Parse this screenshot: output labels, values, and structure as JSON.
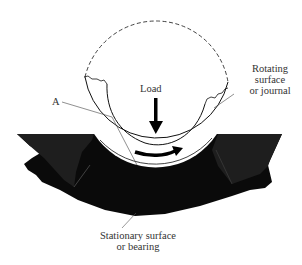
{
  "figure": {
    "labels": {
      "load": "Load",
      "point_a": "A",
      "rotating": [
        "Rotating",
        "surface",
        "or journal"
      ],
      "stationary": [
        "Stationary surface",
        "or bearing"
      ]
    },
    "colors": {
      "ink": "#000000",
      "bearing_fill": "#0a0a0a",
      "bearing_shade": "#1c1c1c",
      "text": "#333333",
      "background": "#ffffff"
    }
  }
}
